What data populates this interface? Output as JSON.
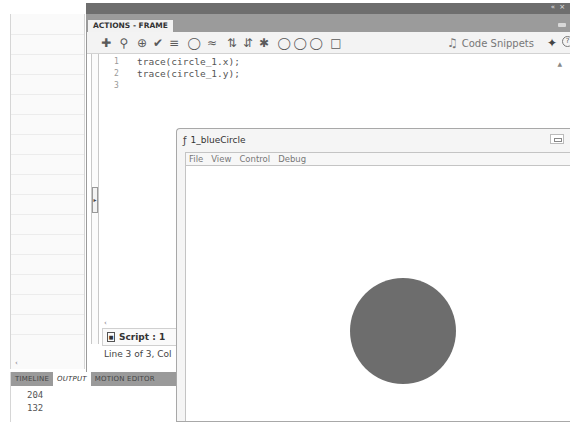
{
  "window_controls": "« ×",
  "actions_panel": {
    "tab_label": "ACTIONS - FRAME",
    "toolbar": {
      "icons": [
        "add-statement-icon",
        "find-icon",
        "insert-target-path-icon",
        "check-syntax-icon",
        "auto-format-icon",
        "show-code-hint-icon",
        "debug-options-icon",
        "collapse-between-braces-icon",
        "collapse-selection-icon",
        "expand-all-icon",
        "apply-block-comment-icon",
        "apply-line-comment-icon",
        "remove-comment-icon",
        "show-hide-toolbox-icon"
      ],
      "code_snippets_label": "Code Snippets",
      "wand_icon": "script-assist-icon",
      "help_icon": "help-icon"
    },
    "code_lines": [
      {
        "num": "1",
        "text": "trace(circle_1.x);"
      },
      {
        "num": "2",
        "text": "trace(circle_1.y);"
      },
      {
        "num": "3",
        "text": ""
      }
    ],
    "script_tab": "Script : 1",
    "status": "Line 3 of 3, Col"
  },
  "bottom_panel": {
    "tabs": [
      {
        "label": "TIMELINE",
        "active": false
      },
      {
        "label": "OUTPUT",
        "active": true
      },
      {
        "label": "MOTION EDITOR",
        "active": false
      }
    ],
    "output_lines": [
      "204",
      "132"
    ]
  },
  "player": {
    "title": "1_blueCircle",
    "menu": [
      "File",
      "View",
      "Control",
      "Debug"
    ],
    "circle_color": "#6d6d6d"
  }
}
